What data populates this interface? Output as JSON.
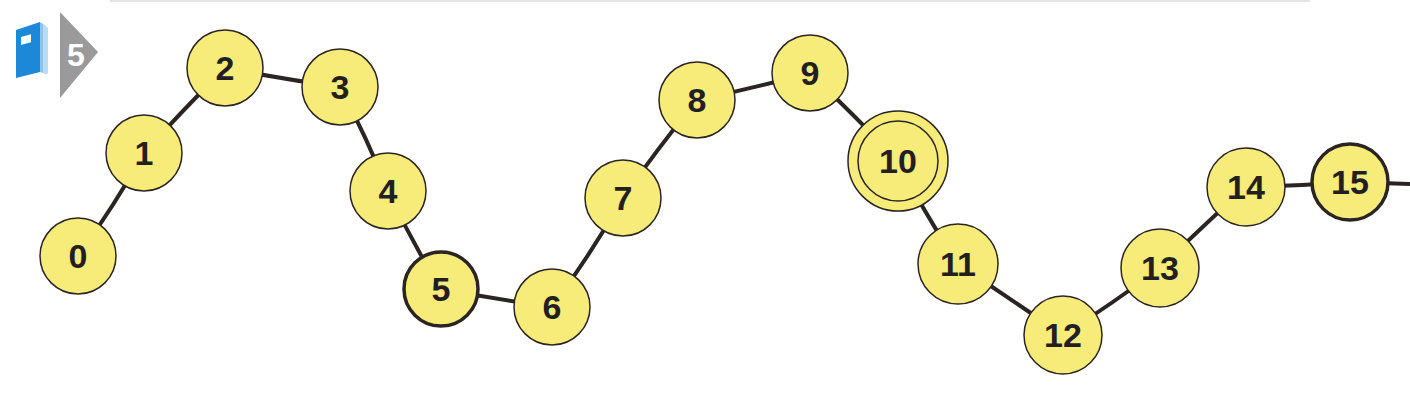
{
  "badge": {
    "icon": "book-icon",
    "number": "5",
    "colors": {
      "book": "#1e88d8",
      "arrow": "#9a9a9a"
    }
  },
  "number_path": {
    "colors": {
      "fill": "#f7ec7a",
      "stroke": "#2a2522",
      "line": "#2a2522"
    },
    "nodes": [
      {
        "label": "0",
        "cx": 78,
        "cy": 256,
        "r": 38,
        "style": "normal"
      },
      {
        "label": "1",
        "cx": 144,
        "cy": 153,
        "r": 38,
        "style": "normal"
      },
      {
        "label": "2",
        "cx": 225,
        "cy": 68,
        "r": 38,
        "style": "normal"
      },
      {
        "label": "3",
        "cx": 340,
        "cy": 87,
        "r": 38,
        "style": "normal"
      },
      {
        "label": "4",
        "cx": 388,
        "cy": 191,
        "r": 38,
        "style": "normal"
      },
      {
        "label": "5",
        "cx": 441,
        "cy": 289,
        "r": 37,
        "style": "bold"
      },
      {
        "label": "6",
        "cx": 552,
        "cy": 307,
        "r": 38,
        "style": "normal"
      },
      {
        "label": "7",
        "cx": 623,
        "cy": 198,
        "r": 38,
        "style": "normal"
      },
      {
        "label": "8",
        "cx": 697,
        "cy": 100,
        "r": 38,
        "style": "normal"
      },
      {
        "label": "9",
        "cx": 810,
        "cy": 73,
        "r": 38,
        "style": "normal"
      },
      {
        "label": "10",
        "cx": 898,
        "cy": 161,
        "r": 50,
        "style": "double"
      },
      {
        "label": "11",
        "cx": 958,
        "cy": 264,
        "r": 40,
        "style": "normal"
      },
      {
        "label": "12",
        "cx": 1063,
        "cy": 335,
        "r": 39,
        "style": "normal"
      },
      {
        "label": "13",
        "cx": 1160,
        "cy": 268,
        "r": 39,
        "style": "normal"
      },
      {
        "label": "14",
        "cx": 1246,
        "cy": 187,
        "r": 39,
        "style": "normal"
      },
      {
        "label": "15",
        "cx": 1350,
        "cy": 182,
        "r": 38,
        "style": "bold"
      }
    ],
    "continues_right": true
  }
}
